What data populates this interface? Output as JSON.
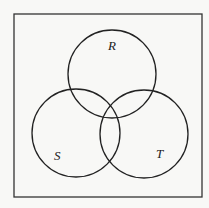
{
  "diagram": {
    "type": "venn",
    "sets": [
      {
        "id": "R",
        "label": "R"
      },
      {
        "id": "S",
        "label": "S"
      },
      {
        "id": "T",
        "label": "T"
      }
    ],
    "colors": {
      "stroke": "#222222",
      "background": "#f8f8f6"
    }
  }
}
